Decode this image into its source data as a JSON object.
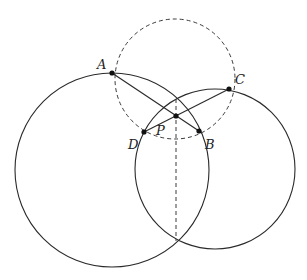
{
  "diagram": {
    "type": "geometry",
    "points": [
      {
        "id": "A",
        "label": "A",
        "x": 112,
        "y": 73,
        "label_x": 97,
        "label_y": 69
      },
      {
        "id": "C",
        "label": "C",
        "x": 229,
        "y": 89,
        "label_x": 235,
        "label_y": 84
      },
      {
        "id": "D",
        "label": "D",
        "x": 144,
        "y": 132,
        "label_x": 128,
        "label_y": 149
      },
      {
        "id": "B",
        "label": "B",
        "x": 199,
        "y": 131,
        "label_x": 205,
        "label_y": 149
      },
      {
        "id": "P",
        "label": "P",
        "x": 176,
        "y": 116,
        "label_x": 156,
        "label_y": 135
      }
    ],
    "circles": [
      {
        "name": "left-circle",
        "cx": 112,
        "cy": 170,
        "r": 97,
        "style": "solid"
      },
      {
        "name": "right-circle",
        "cx": 215,
        "cy": 169,
        "r": 80,
        "style": "solid"
      },
      {
        "name": "dashed-circle",
        "cx": 175,
        "cy": 79,
        "r": 60,
        "style": "dashed"
      }
    ],
    "segments": [
      {
        "name": "segment-AB",
        "from": "A",
        "to": "B",
        "style": "solid"
      },
      {
        "name": "segment-CD",
        "from": "C",
        "to": "D",
        "style": "solid"
      },
      {
        "name": "radical-axis",
        "x1": 176,
        "y1": 99,
        "x2": 176,
        "y2": 241,
        "style": "dashed"
      }
    ]
  }
}
